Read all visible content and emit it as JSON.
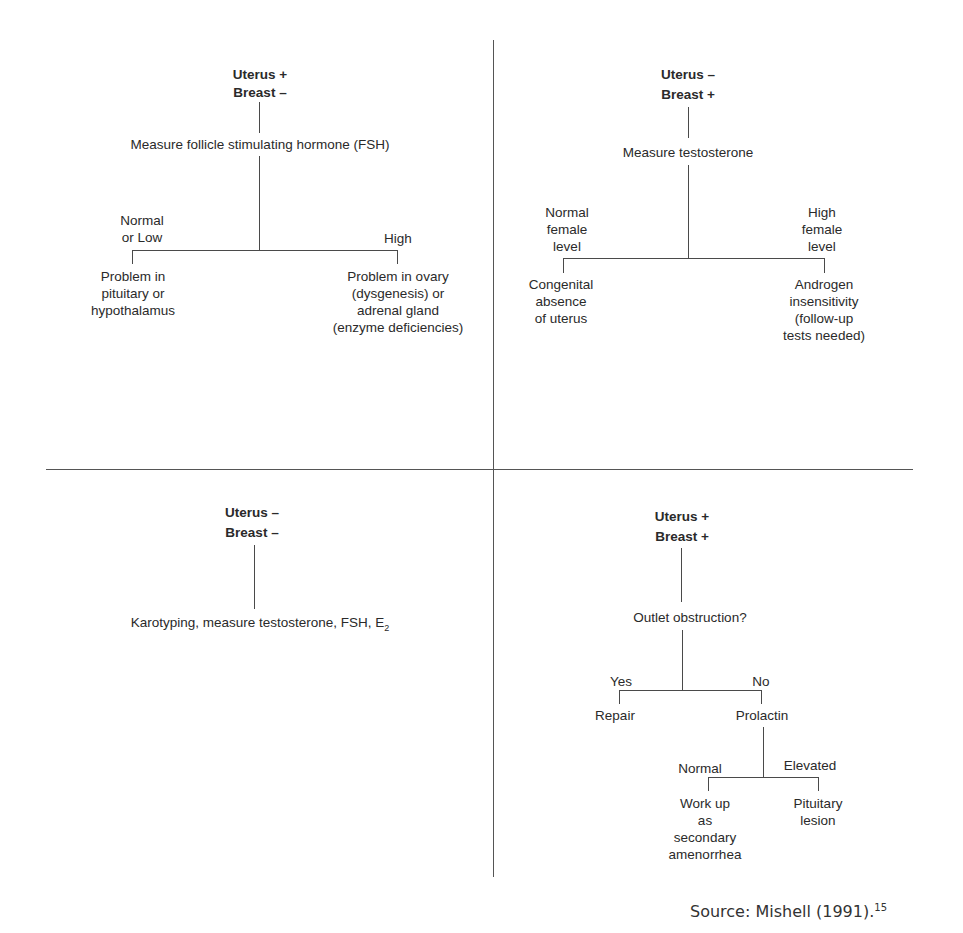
{
  "quadrants": {
    "top_left": {
      "header": [
        "Uterus +",
        "Breast –"
      ],
      "step": "Measure follicle stimulating hormone (FSH)",
      "branches": [
        {
          "label": [
            "Normal",
            "or Low"
          ],
          "outcome": [
            "Problem in",
            "pituitary or",
            "hypothalamus"
          ]
        },
        {
          "label": [
            "High"
          ],
          "outcome": [
            "Problem in ovary",
            "(dysgenesis) or",
            "adrenal gland",
            "(enzyme deficiencies)"
          ]
        }
      ]
    },
    "top_right": {
      "header": [
        "Uterus –",
        "Breast +"
      ],
      "step": "Measure testosterone",
      "branches": [
        {
          "label": [
            "Normal",
            "female",
            "level"
          ],
          "outcome": [
            "Congenital",
            "absence",
            "of uterus"
          ]
        },
        {
          "label": [
            "High",
            "female",
            "level"
          ],
          "outcome": [
            "Androgen",
            "insensitivity",
            "(follow-up",
            "tests needed)"
          ]
        }
      ]
    },
    "bottom_left": {
      "header": [
        "Uterus –",
        "Breast –"
      ],
      "step_main": "Karotyping, measure testosterone, FSH, E",
      "step_sub": "2"
    },
    "bottom_right": {
      "header": [
        "Uterus +",
        "Breast +"
      ],
      "step": "Outlet obstruction?",
      "branches": [
        {
          "label": "Yes",
          "outcome": "Repair"
        },
        {
          "label": "No",
          "outcome": "Prolactin"
        }
      ],
      "sub_branches": [
        {
          "label": "Normal",
          "outcome": [
            "Work up",
            "as",
            "secondary",
            "amenorrhea"
          ]
        },
        {
          "label": "Elevated",
          "outcome": [
            "Pituitary",
            "lesion"
          ]
        }
      ]
    }
  },
  "source": {
    "text": "Source: Mishell (1991).",
    "footnote": "15"
  }
}
